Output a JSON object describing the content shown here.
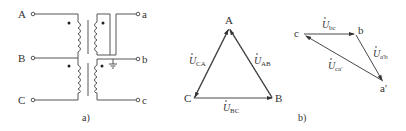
{
  "diagram_a": {
    "caption": "a)",
    "primary_terminals": [
      "A",
      "B",
      "C"
    ],
    "secondary_terminals": [
      "a",
      "b",
      "c"
    ]
  },
  "diagram_b": {
    "caption": "b)",
    "triangle_1": {
      "vertices": [
        "A",
        "B",
        "C"
      ],
      "phasors": [
        {
          "main": "U",
          "sub": "AB"
        },
        {
          "main": "U",
          "sub": "BC"
        },
        {
          "main": "U",
          "sub": "CA"
        }
      ]
    },
    "triangle_2": {
      "vertices": [
        "c",
        "b",
        "a'"
      ],
      "phasors": [
        {
          "main": "U",
          "sub": "bc"
        },
        {
          "main": "U",
          "sub": "a'b"
        },
        {
          "main": "U",
          "sub": "ca'"
        }
      ]
    }
  },
  "colors": {
    "line": "#444444",
    "text": "#333333"
  }
}
